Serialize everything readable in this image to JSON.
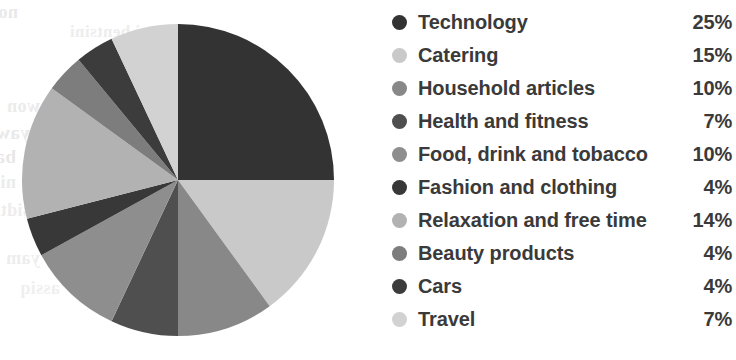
{
  "chart_data": {
    "type": "pie",
    "title": "",
    "subtitle": "",
    "xlabel": "",
    "ylabel": "",
    "grid": false,
    "legend_position": "right",
    "start_angle_deg": 0,
    "direction": "clockwise",
    "units": "%",
    "categories": [
      "Technology",
      "Catering",
      "Household articles",
      "Health and fitness",
      "Food, drink and tobacco",
      "Fashion and clothing",
      "Relaxation and free time",
      "Beauty products",
      "Cars",
      "Travel"
    ],
    "values": [
      25,
      15,
      10,
      7,
      10,
      4,
      14,
      4,
      4,
      7
    ],
    "value_labels": [
      "25%",
      "15%",
      "10%",
      "7%",
      "10%",
      "4%",
      "14%",
      "4%",
      "4%",
      "7%"
    ],
    "colors": [
      "#333333",
      "#c9c9c9",
      "#888888",
      "#4f4f4f",
      "#8e8e8e",
      "#383838",
      "#b2b2b2",
      "#7d7d7d",
      "#3c3c3c",
      "#d2d2d2"
    ],
    "total": 100
  },
  "legend": {
    "rows": [
      {
        "label": "Technology",
        "value": "25%",
        "color": "#333333"
      },
      {
        "label": "Catering",
        "value": "15%",
        "color": "#c9c9c9"
      },
      {
        "label": "Household articles",
        "value": "10%",
        "color": "#888888"
      },
      {
        "label": "Health and fitness",
        "value": "7%",
        "color": "#4f4f4f"
      },
      {
        "label": "Food, drink and tobacco",
        "value": "10%",
        "color": "#8e8e8e"
      },
      {
        "label": "Fashion and clothing",
        "value": "4%",
        "color": "#383838"
      },
      {
        "label": "Relaxation and free time",
        "value": "14%",
        "color": "#b2b2b2"
      },
      {
        "label": "Beauty products",
        "value": "4%",
        "color": "#7d7d7d"
      },
      {
        "label": "Cars",
        "value": "4%",
        "color": "#3c3c3c"
      },
      {
        "label": "Travel",
        "value": "7%",
        "color": "#d2d2d2"
      }
    ]
  },
  "scan_artifacts": {
    "ghost_lines": [
      {
        "text": "notional",
        "x": 18,
        "y": 2,
        "size": 18,
        "opacity": 0.55
      },
      {
        "text": "ni bentsini",
        "x": 150,
        "y": 22,
        "size": 17,
        "opacity": 0.45
      },
      {
        "text": "erit",
        "x": 120,
        "y": 60,
        "size": 18,
        "opacity": 0.4
      },
      {
        "text": "won",
        "x": 40,
        "y": 96,
        "size": 18,
        "opacity": 0.5
      },
      {
        "text": "yaw a",
        "x": 30,
        "y": 122,
        "size": 19,
        "opacity": 0.55
      },
      {
        "text": "bailsitas",
        "x": 16,
        "y": 146,
        "size": 19,
        "opacity": 0.6
      },
      {
        "text": "nislqmo",
        "x": 16,
        "y": 172,
        "size": 18,
        "opacity": 0.5
      },
      {
        "text": "owt neew",
        "x": 110,
        "y": 170,
        "size": 17,
        "opacity": 0.4
      },
      {
        "text": "sidt erofer",
        "x": 30,
        "y": 200,
        "size": 18,
        "opacity": 0.45
      },
      {
        "text": "monose",
        "x": 160,
        "y": 220,
        "size": 18,
        "opacity": 0.4
      },
      {
        "text": "yam",
        "x": 40,
        "y": 248,
        "size": 18,
        "opacity": 0.45
      },
      {
        "text": "edt ni",
        "x": 150,
        "y": 256,
        "size": 17,
        "opacity": 0.35
      },
      {
        "text": "assiq",
        "x": 60,
        "y": 278,
        "size": 18,
        "opacity": 0.4
      }
    ]
  }
}
